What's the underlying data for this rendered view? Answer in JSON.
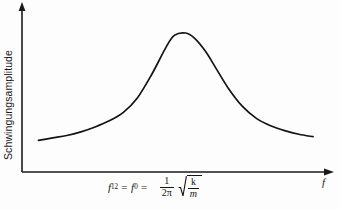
{
  "figure": {
    "ylabel": "Schwingungsamplitude",
    "xlabel": "f",
    "formula": {
      "lhs_symbol": "f",
      "lhs_subscript": "12",
      "equals_1": "=",
      "mid_symbol": "f",
      "mid_subscript": "0",
      "equals_2": "=",
      "fraction_numerator": "1",
      "fraction_denominator_number": "2",
      "fraction_denominator_symbol": "π",
      "radical_numerator": "k",
      "radical_denominator": "m"
    },
    "colors": {
      "curve": "#141414",
      "axis": "#1a1a1a",
      "background": "#fdfdfd",
      "text": "#15150f"
    }
  },
  "chart_data": {
    "type": "line",
    "title": "",
    "xlabel": "f",
    "ylabel": "Schwingungsamplitude",
    "grid": false,
    "legend": null,
    "xlim": [
      0,
      1
    ],
    "ylim": [
      0,
      1
    ],
    "axis_ticks": {
      "x": [],
      "y": []
    },
    "annotations": [
      {
        "text": "f₁₂ = f₀ = (1/2π)√(k/m)",
        "position": "below-x-axis-center",
        "describes": "resonance frequency at curve peak"
      }
    ],
    "series": [
      {
        "name": "Resonanzkurve",
        "comment": "Resonance amplitude vs frequency; normalized units read off the drawn curve",
        "x": [
          0.03,
          0.08,
          0.13,
          0.18,
          0.23,
          0.28,
          0.33,
          0.38,
          0.43,
          0.48,
          0.51,
          0.55,
          0.58,
          0.62,
          0.66,
          0.7,
          0.75,
          0.8,
          0.85,
          0.9,
          0.95,
          1.0
        ],
        "y": [
          0.12,
          0.14,
          0.16,
          0.19,
          0.23,
          0.28,
          0.35,
          0.47,
          0.66,
          0.88,
          0.98,
          1.0,
          0.96,
          0.85,
          0.7,
          0.55,
          0.4,
          0.3,
          0.24,
          0.2,
          0.17,
          0.15
        ]
      }
    ],
    "peak": {
      "x": 0.55,
      "y": 1.0,
      "label": "f₀"
    }
  }
}
